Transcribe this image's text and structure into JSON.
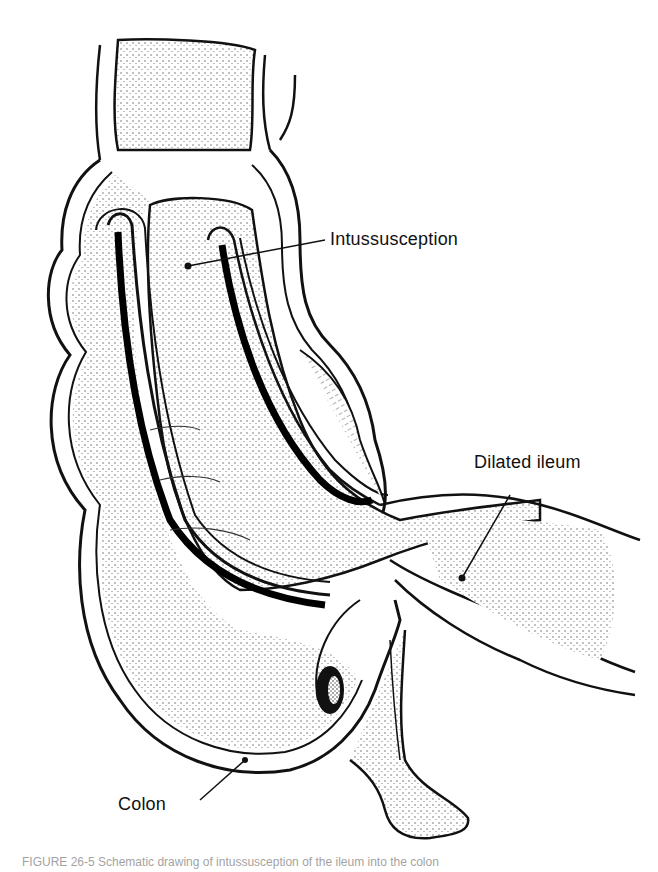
{
  "figure": {
    "labels": {
      "intussusception": "Intussusception",
      "dilated_ileum": "Dilated ileum",
      "colon": "Colon"
    },
    "caption_partial": "FIGURE 26-5  Schematic drawing of intussusception of the ileum into the colon"
  }
}
